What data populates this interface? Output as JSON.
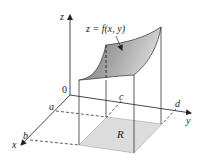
{
  "figure": {
    "type": "3d-surface-over-rectangle",
    "surface_label": "z = f(x, y)",
    "region_label": "R",
    "axes": {
      "x": {
        "label": "x",
        "ticks": [
          "a",
          "b"
        ]
      },
      "y": {
        "label": "y",
        "ticks": [
          "c",
          "d"
        ]
      },
      "z": {
        "label": "z"
      },
      "origin_label": "0"
    },
    "colors": {
      "axis": "#333333",
      "surface_dark": "#7d7d7d",
      "surface_light": "#d6d6d6",
      "region_fill": "#dcdcdc",
      "background": "#ffffff"
    }
  }
}
